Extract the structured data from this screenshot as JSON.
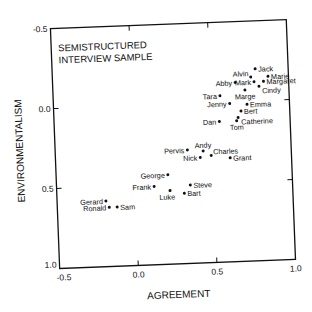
{
  "chart_data": {
    "type": "scatter",
    "title_lines": [
      "SEMISTRUCTURED",
      "INTERVIEW SAMPLE"
    ],
    "xlabel": "AGREEMENT",
    "ylabel": "ENVIRONMENTALISM",
    "xlim": [
      -0.5,
      1.0
    ],
    "ylim": [
      -0.5,
      1.0
    ],
    "y_inverted": true,
    "x_ticks": [
      "-0.5",
      "0.0",
      "0.5",
      "1.0"
    ],
    "y_ticks": [
      "-0.5",
      "0.0",
      "0.5",
      "1.0"
    ],
    "grid": false,
    "legend": null,
    "points": [
      {
        "label": "Jack",
        "x": 0.79,
        "y": -0.2,
        "label_pos": "right"
      },
      {
        "label": "Marie",
        "x": 0.87,
        "y": -0.15,
        "label_pos": "right"
      },
      {
        "label": "Alvin",
        "x": 0.76,
        "y": -0.15,
        "label_pos": "left-up"
      },
      {
        "label": "Mark",
        "x": 0.78,
        "y": -0.12,
        "label_pos": "left"
      },
      {
        "label": "Margaret",
        "x": 0.84,
        "y": -0.12,
        "label_pos": "right"
      },
      {
        "label": "Cindy",
        "x": 0.81,
        "y": -0.09,
        "label_pos": "right-down"
      },
      {
        "label": "Abby",
        "x": 0.66,
        "y": -0.12,
        "label_pos": "left"
      },
      {
        "label": "Marge",
        "x": 0.72,
        "y": -0.07,
        "label_pos": "below"
      },
      {
        "label": "Tara",
        "x": 0.56,
        "y": -0.04,
        "label_pos": "left"
      },
      {
        "label": "Jenny",
        "x": 0.62,
        "y": 0.01,
        "label_pos": "left"
      },
      {
        "label": "Emma",
        "x": 0.73,
        "y": 0.02,
        "label_pos": "right"
      },
      {
        "label": "Bert",
        "x": 0.69,
        "y": 0.06,
        "label_pos": "right"
      },
      {
        "label": "Dan",
        "x": 0.55,
        "y": 0.12,
        "label_pos": "left"
      },
      {
        "label": "Catherine",
        "x": 0.67,
        "y": 0.1,
        "label_pos": "right-down"
      },
      {
        "label": "Tom",
        "x": 0.66,
        "y": 0.12,
        "label_pos": "below"
      },
      {
        "label": "Pervis",
        "x": 0.34,
        "y": 0.29,
        "label_pos": "left"
      },
      {
        "label": "Andy",
        "x": 0.44,
        "y": 0.3,
        "label_pos": "above"
      },
      {
        "label": "Nick",
        "x": 0.42,
        "y": 0.34,
        "label_pos": "left"
      },
      {
        "label": "Charles",
        "x": 0.49,
        "y": 0.33,
        "label_pos": "right-up"
      },
      {
        "label": "Grant",
        "x": 0.61,
        "y": 0.35,
        "label_pos": "right"
      },
      {
        "label": "George",
        "x": 0.21,
        "y": 0.44,
        "label_pos": "left"
      },
      {
        "label": "Frank",
        "x": 0.12,
        "y": 0.51,
        "label_pos": "left"
      },
      {
        "label": "Steve",
        "x": 0.35,
        "y": 0.51,
        "label_pos": "right"
      },
      {
        "label": "Luke",
        "x": 0.22,
        "y": 0.54,
        "label_pos": "below-left"
      },
      {
        "label": "Bart",
        "x": 0.31,
        "y": 0.56,
        "label_pos": "right"
      },
      {
        "label": "Gerard",
        "x": -0.19,
        "y": 0.59,
        "label_pos": "left"
      },
      {
        "label": "Ronald",
        "x": -0.17,
        "y": 0.63,
        "label_pos": "left"
      },
      {
        "label": "Sam",
        "x": -0.12,
        "y": 0.63,
        "label_pos": "right"
      }
    ]
  },
  "colors": {
    "ink": "#111111",
    "background": "#ffffff"
  }
}
